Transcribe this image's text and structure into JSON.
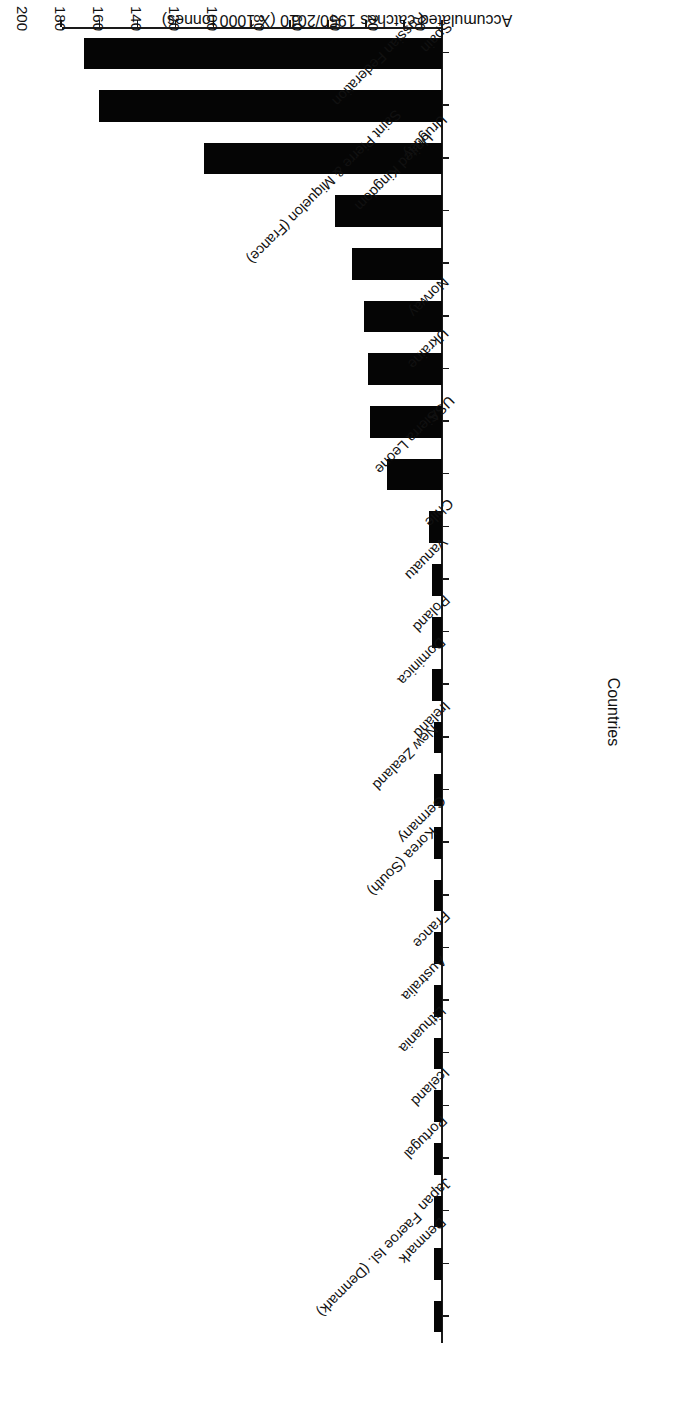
{
  "chart_data": {
    "type": "bar",
    "orientation": "horizontal",
    "title": "",
    "xlabel": "Countries",
    "ylabel": "Accumulated catches 1950/2010 (X 1000 tonnes)",
    "ylim": [
      0,
      200
    ],
    "ytick_step": 20,
    "yticks": [
      "0",
      "20",
      "40",
      "60",
      "80",
      "100",
      "120",
      "140",
      "160",
      "180",
      "200"
    ],
    "grid": false,
    "legend": null,
    "bar_color": "#050505",
    "axis_color": "#1a1a1a",
    "categories": [
      "Spain",
      "Russian Federation",
      "Uruguay",
      "United Kingdom",
      "Saint Pierre & Miquelon (France)",
      "Norway",
      "Ukraine",
      "USA",
      "Sierra Leone",
      "Chile",
      "Vanuatu",
      "Poland",
      "Dominica",
      "Ireland",
      "New Zealand",
      "Germany",
      "Korea (South)",
      "France",
      "Australia",
      "Lithuania",
      "Iceland",
      "Portugal",
      "Japan",
      "Denmark",
      "Faeroe Isl. (Denmark)"
    ],
    "values": [
      188,
      180,
      125,
      56,
      47,
      41,
      39,
      38,
      29,
      7,
      5,
      5,
      5,
      4,
      4,
      4,
      4,
      4,
      4,
      4,
      4,
      4,
      4,
      4,
      4
    ]
  },
  "page": {
    "rotation_note": "180"
  }
}
